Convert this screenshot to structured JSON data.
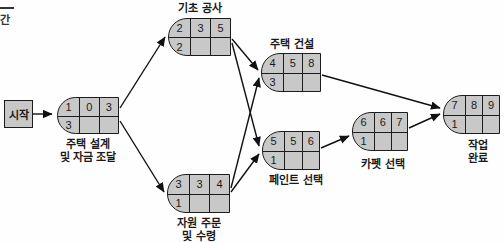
{
  "diagram": {
    "type": "project-network-pert",
    "background": "#fefefe",
    "colors": {
      "node_fill": "#c8c8c8",
      "node_border": "#1c1c1c",
      "arrow": "#111111",
      "text": "#1a1a1a"
    },
    "legend_fragment": {
      "label": "간"
    },
    "start": {
      "label": "시작"
    },
    "nodes": [
      {
        "id": "design",
        "label": "주택 설계\n및 자금 조달",
        "cells": [
          "1",
          "0",
          "3"
        ],
        "bottom": "3"
      },
      {
        "id": "foundation",
        "label": "기초 공사",
        "cells": [
          "2",
          "3",
          "5"
        ],
        "bottom": "2"
      },
      {
        "id": "resource",
        "label": "자원 주문\n및 수령",
        "cells": [
          "3",
          "3",
          "4"
        ],
        "bottom": "1"
      },
      {
        "id": "construction",
        "label": "주택 건설",
        "cells": [
          "4",
          "5",
          "8"
        ],
        "bottom": "3"
      },
      {
        "id": "paint",
        "label": "페인트 선택",
        "cells": [
          "5",
          "5",
          "6"
        ],
        "bottom": "1"
      },
      {
        "id": "carpet",
        "label": "카펫 선택",
        "cells": [
          "6",
          "6",
          "7"
        ],
        "bottom": "1"
      },
      {
        "id": "complete",
        "label": "작업 완료",
        "cells": [
          "7",
          "8",
          "9"
        ],
        "bottom": "1"
      }
    ],
    "edges": [
      {
        "from": "시작",
        "to": "주택 설계 및 자금 조달"
      },
      {
        "from": "주택 설계 및 자금 조달",
        "to": "기초 공사"
      },
      {
        "from": "주택 설계 및 자금 조달",
        "to": "자원 주문 및 수령"
      },
      {
        "from": "기초 공사",
        "to": "주택 건설"
      },
      {
        "from": "기초 공사",
        "to": "페인트 선택"
      },
      {
        "from": "자원 주문 및 수령",
        "to": "주택 건설"
      },
      {
        "from": "자원 주문 및 수령",
        "to": "페인트 선택"
      },
      {
        "from": "주택 건설",
        "to": "작업 완료"
      },
      {
        "from": "페인트 선택",
        "to": "카펫 선택"
      },
      {
        "from": "카펫 선택",
        "to": "작업 완료"
      }
    ]
  }
}
